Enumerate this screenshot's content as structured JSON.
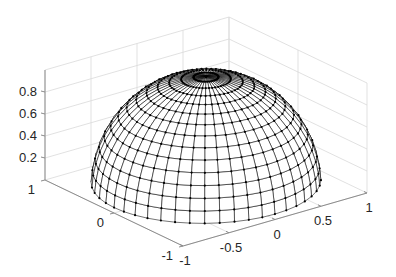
{
  "chart_data": {
    "type": "surface3d",
    "title": "",
    "xlabel": "",
    "ylabel": "",
    "zlabel": "",
    "xlim": [
      -1,
      1
    ],
    "ylim": [
      -1,
      1
    ],
    "zlim": [
      0,
      1
    ],
    "grid": true,
    "x_ticks": [
      -1,
      -0.5,
      0,
      0.5,
      1
    ],
    "x_tick_labels": [
      "-1",
      "-0.5",
      "0",
      "0.5",
      "1"
    ],
    "y_ticks": [
      -1,
      0,
      1
    ],
    "y_tick_labels": [
      "-1",
      "0",
      "1"
    ],
    "z_ticks": [
      0.2,
      0.4,
      0.6,
      0.8
    ],
    "z_tick_labels": [
      "0.2",
      "0.4",
      "0.6",
      "0.8"
    ],
    "surface": {
      "shape": "hemisphere",
      "radius": 1,
      "latitude_rings": 14,
      "longitude_lines": 48,
      "top_ring_z": 0.98,
      "markers": true,
      "line_color": "#000000",
      "face_color": "#ffffff"
    },
    "colors": {
      "grid": "#d9d9d9",
      "axis": "#8c8c8c",
      "text": "#262626"
    }
  }
}
